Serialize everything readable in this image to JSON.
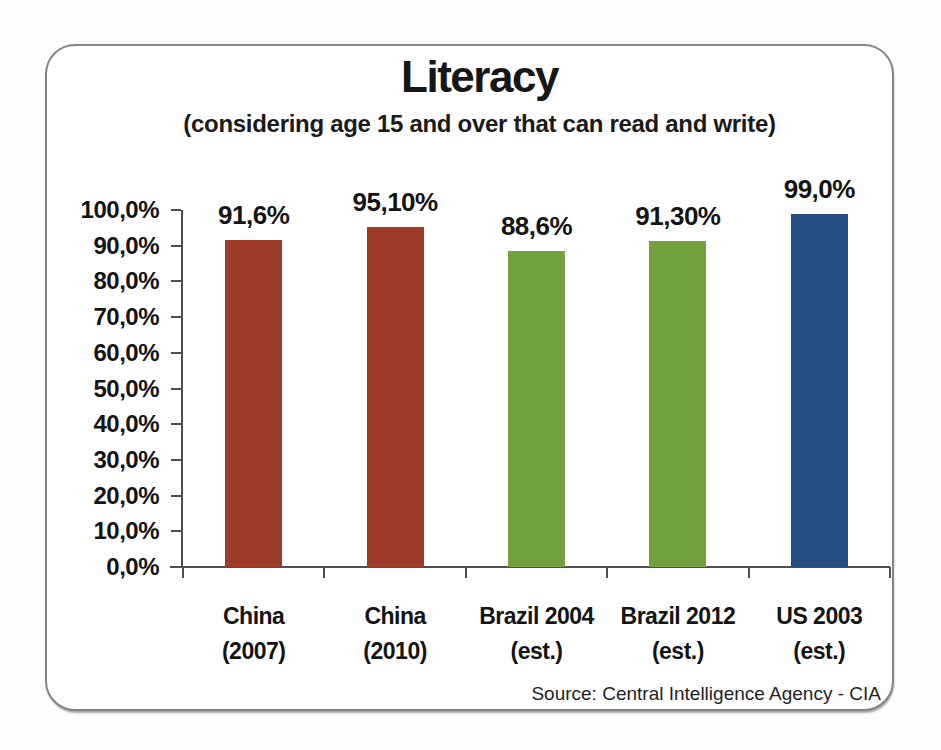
{
  "page": {
    "background_color": "#fefefe"
  },
  "frame": {
    "border_color": "#858585"
  },
  "chart_data": {
    "type": "bar",
    "title": "Literacy",
    "subtitle": "(considering age 15 and over that can read and write)",
    "source": "Source: Central Intelligence Agency - CIA",
    "categories": [
      "China (2007)",
      "China (2010)",
      "Brazil 2004 (est.)",
      "Brazil 2012 (est.)",
      "US 2003 (est.)"
    ],
    "category_lines": [
      [
        "China",
        "(2007)"
      ],
      [
        "China",
        "(2010)"
      ],
      [
        "Brazil 2004",
        "(est.)"
      ],
      [
        "Brazil 2012",
        "(est.)"
      ],
      [
        "US 2003",
        "(est.)"
      ]
    ],
    "values": [
      91.6,
      95.1,
      88.6,
      91.3,
      99.0
    ],
    "value_labels": [
      "91,6%",
      "95,10%",
      "88,6%",
      "91,30%",
      "99,0%"
    ],
    "bar_colors": [
      "#9E3A28",
      "#9E3A28",
      "#72A13D",
      "#72A13D",
      "#254E82"
    ],
    "y_tick_labels": [
      "0,0%",
      "10,0%",
      "20,0%",
      "30,0%",
      "40,0%",
      "50,0%",
      "60,0%",
      "70,0%",
      "80,0%",
      "90,0%",
      "100,0%"
    ],
    "y_tick_values": [
      0,
      10,
      20,
      30,
      40,
      50,
      60,
      70,
      80,
      90,
      100
    ],
    "ylim": [
      0,
      100
    ],
    "xlabel": "",
    "ylabel": "",
    "grid": false,
    "legend": "none",
    "axis_color": "#4f4f4f",
    "text_color": "#141414"
  }
}
